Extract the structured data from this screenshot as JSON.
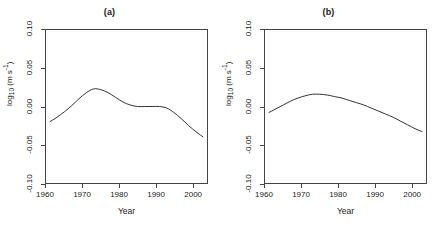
{
  "figure": {
    "background": "#ffffff",
    "line_color": "#333333",
    "axis_color": "#444444"
  },
  "chart_data": [
    {
      "type": "line",
      "title": "(a)",
      "xlabel": "Year",
      "ylabel": "log10 (m s-1)",
      "ylabel_base": "log",
      "ylabel_sub": "10",
      "ylabel_unit_open": " (m s",
      "ylabel_unit_sup": "-1",
      "ylabel_unit_close": ")",
      "xlim": [
        1960,
        2004
      ],
      "ylim": [
        -0.1,
        0.1
      ],
      "xticks": [
        1960,
        1970,
        1980,
        1990,
        2000
      ],
      "xticklabels": [
        "1960",
        "1970",
        "1980",
        "1990",
        "2000"
      ],
      "yticks": [
        -0.1,
        -0.05,
        0.0,
        0.05,
        0.1
      ],
      "yticklabels": [
        "-0.10",
        "-0.05",
        "0.00",
        "0.05",
        "0.10"
      ],
      "grid": false,
      "legend": "none",
      "series": [
        {
          "name": "smooth-trend-a",
          "x": [
            1961,
            1963,
            1965,
            1967,
            1969,
            1971,
            1973,
            1975,
            1977,
            1979,
            1981,
            1983,
            1985,
            1987,
            1989,
            1991,
            1993,
            1995,
            1997,
            1999,
            2001,
            2003
          ],
          "values": [
            -0.02,
            -0.014,
            -0.007,
            0.001,
            0.01,
            0.018,
            0.023,
            0.022,
            0.018,
            0.012,
            0.006,
            0.002,
            0.0,
            0.0,
            0.0,
            0.0,
            -0.002,
            -0.008,
            -0.016,
            -0.025,
            -0.033,
            -0.04
          ]
        }
      ]
    },
    {
      "type": "line",
      "title": "(b)",
      "xlabel": "Year",
      "ylabel": "log10 (m s-1)",
      "ylabel_base": "log",
      "ylabel_sub": "10",
      "ylabel_unit_open": " (m s",
      "ylabel_unit_sup": "-1",
      "ylabel_unit_close": ")",
      "xlim": [
        1960,
        2004
      ],
      "ylim": [
        -0.1,
        0.1
      ],
      "xticks": [
        1960,
        1970,
        1980,
        1990,
        2000
      ],
      "xticklabels": [
        "1960",
        "1970",
        "1980",
        "1990",
        "2000"
      ],
      "yticks": [
        -0.1,
        -0.05,
        0.0,
        0.05,
        0.1
      ],
      "yticklabels": [
        "-0.10",
        "-0.05",
        "0.00",
        "0.05",
        "0.10"
      ],
      "grid": false,
      "legend": "none",
      "series": [
        {
          "name": "smooth-trend-b",
          "x": [
            1961,
            1963,
            1965,
            1967,
            1969,
            1971,
            1973,
            1975,
            1977,
            1979,
            1981,
            1983,
            1985,
            1987,
            1989,
            1991,
            1993,
            1995,
            1997,
            1999,
            2001,
            2003
          ],
          "values": [
            -0.008,
            -0.003,
            0.002,
            0.007,
            0.011,
            0.014,
            0.016,
            0.016,
            0.015,
            0.013,
            0.011,
            0.008,
            0.005,
            0.002,
            -0.002,
            -0.006,
            -0.01,
            -0.014,
            -0.019,
            -0.024,
            -0.029,
            -0.033
          ]
        }
      ]
    }
  ]
}
